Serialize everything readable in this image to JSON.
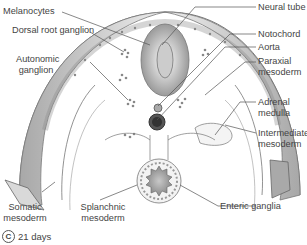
{
  "figure": {
    "panel_letter": "C",
    "caption": "21 days",
    "structures": [
      "neural tube",
      "notochord",
      "aorta",
      "gut tube",
      "somatic mesoderm",
      "splanchnic mesoderm",
      "neural crest cells"
    ]
  },
  "labels": {
    "left": [
      {
        "id": "melanocytes",
        "text": "Melanocytes"
      },
      {
        "id": "dorsal_root_ganglion",
        "text": "Dorsal root ganglion"
      },
      {
        "id": "autonomic_ganglion_1",
        "text": "Autonomic"
      },
      {
        "id": "autonomic_ganglion_2",
        "text": "ganglion"
      }
    ],
    "right": [
      {
        "id": "neural_tube",
        "text": "Neural tube"
      },
      {
        "id": "notochord",
        "text": "Notochord"
      },
      {
        "id": "aorta",
        "text": "Aorta"
      },
      {
        "id": "paraxial_1",
        "text": "Paraxial"
      },
      {
        "id": "paraxial_2",
        "text": "mesoderm"
      },
      {
        "id": "adrenal_1",
        "text": "Adrenal"
      },
      {
        "id": "adrenal_2",
        "text": "medulla"
      },
      {
        "id": "intermediate_1",
        "text": "Intermediate"
      },
      {
        "id": "intermediate_2",
        "text": "mesoderm"
      }
    ],
    "bottom": [
      {
        "id": "somatic_1",
        "text": "Somatic"
      },
      {
        "id": "somatic_2",
        "text": "mesoderm"
      },
      {
        "id": "splanchnic_1",
        "text": "Splanchnic"
      },
      {
        "id": "splanchnic_2",
        "text": "mesoderm"
      },
      {
        "id": "enteric",
        "text": "Enteric ganglia"
      }
    ]
  },
  "colors": {
    "line": "#555555",
    "fill_light": "#f2f2f2",
    "fill_mid": "#d0d0d0",
    "fill_dark": "#8a8a8a"
  }
}
